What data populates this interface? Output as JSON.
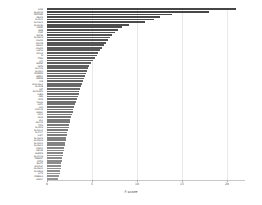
{
  "chart_data": {
    "type": "bar",
    "orientation": "horizontal",
    "title": "",
    "xlabel": "F-score",
    "ylabel": "",
    "xlim": [
      0,
      22
    ],
    "grid": true,
    "legend": null,
    "bar_color": "#4d4d4d",
    "xticks": [
      0,
      5,
      10,
      15,
      20
    ],
    "xtick_labels": [
      "0",
      "5",
      "10",
      "15",
      "20"
    ],
    "categories": [
      "ACE2",
      "SLC6A19",
      "TMPRSS2",
      "ABCC2",
      "SLC5A1",
      "SLC15A1",
      "SLC6A20",
      "ANPEP",
      "MME",
      "PIGR",
      "MGAM",
      "SLC26A3",
      "CDHR5",
      "MYO7B",
      "USH1C",
      "CDHR2",
      "AQP10",
      "APOA4",
      "SI",
      "TREH",
      "LCT",
      "ENPEP",
      "DPP4",
      "SLC7A9",
      "SLC3A1",
      "XPNPEP2",
      "MEP1A",
      "MEP1B",
      "ACE",
      "NAALADL1",
      "SLC51B",
      "AGT",
      "SLC9A3R1",
      "CUBN",
      "AMN",
      "LRP2",
      "FOLH1",
      "GGT1",
      "ALPI",
      "ANXA13",
      "HNF4A",
      "CDX1",
      "CDX2",
      "VIL1",
      "MUC13",
      "TFF3",
      "SLC2A2",
      "SLC5A11",
      "SLC7A7",
      "AQP7",
      "SLC16A3",
      "SLC22A4",
      "SLC13A1",
      "SLC34A1",
      "PDZK1",
      "ABCG2",
      "NHERF4",
      "SLC17A4",
      "TMEM27",
      "CLTRN",
      "B0AT1",
      "MGAT4C",
      "SLC36A1",
      "SLC38A2",
      "LCT2",
      "CREB3L3",
      "HNF1A"
    ],
    "values": [
      21.0,
      18.0,
      13.9,
      12.6,
      11.9,
      10.9,
      9.1,
      8.3,
      7.9,
      7.5,
      7.2,
      7.0,
      6.8,
      6.6,
      6.3,
      6.1,
      5.9,
      5.7,
      5.5,
      5.3,
      5.1,
      4.9,
      4.7,
      4.6,
      4.4,
      4.3,
      4.2,
      4.1,
      4.0,
      3.9,
      3.8,
      3.7,
      3.6,
      3.5,
      3.4,
      3.3,
      3.2,
      3.1,
      3.0,
      2.9,
      2.85,
      2.8,
      2.7,
      2.6,
      2.5,
      2.45,
      2.4,
      2.3,
      2.25,
      2.2,
      2.15,
      2.1,
      2.0,
      1.95,
      1.9,
      1.85,
      1.8,
      1.75,
      1.7,
      1.65,
      1.6,
      1.55,
      1.5,
      1.45,
      1.4,
      1.3,
      1.2
    ]
  }
}
